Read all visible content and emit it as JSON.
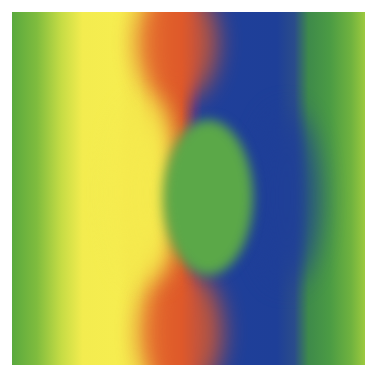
{
  "image": {
    "description": "Abstract color field with vertical bands: green, yellow, red/orange, blue, green; central green elliptical region",
    "colors": {
      "green": "#5aa93e",
      "yellow": "#f6ed50",
      "red": "#d8552a",
      "blue": "#1f3f9a",
      "center_green": "#5ba848"
    }
  }
}
